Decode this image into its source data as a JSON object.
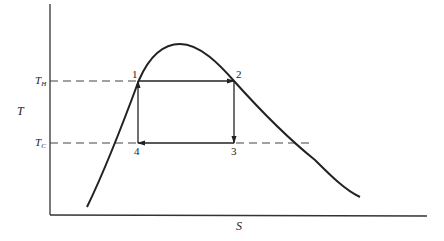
{
  "diagram": {
    "axes": {
      "x_label": "S",
      "y_label": "T"
    },
    "levels": {
      "hot": {
        "main": "T",
        "sub": "H"
      },
      "cold": {
        "main": "T",
        "sub": "C"
      }
    },
    "points": [
      {
        "id": "1",
        "label": "1"
      },
      {
        "id": "2",
        "label": "2"
      },
      {
        "id": "3",
        "label": "3"
      },
      {
        "id": "4",
        "label": "4"
      }
    ],
    "colors": {
      "line": "#222222",
      "dash": "#444444",
      "background": "#ffffff"
    }
  }
}
